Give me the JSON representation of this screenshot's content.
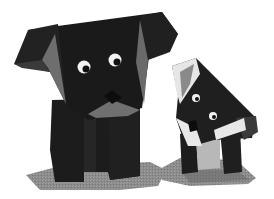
{
  "image": {
    "description": "Photo of two black origami dogs (one large, one small) standing on grey paper bases against a white background",
    "subjects": [
      {
        "name": "large origami dog",
        "position": "left",
        "color": "#1a1a1a"
      },
      {
        "name": "small origami dog",
        "position": "right",
        "color": "#222222"
      }
    ]
  },
  "colors": {
    "background": "#ffffff",
    "paper_black": "#1b1b1b",
    "paper_dark": "#2a2a2a",
    "fold_grey": "#6e6e6e",
    "fold_light": "#a9a9a9",
    "white_fold": "#e6e6e6",
    "base_grey": "#8c8c8c",
    "eye_white": "#f2f2f2",
    "pupil": "#111111"
  }
}
